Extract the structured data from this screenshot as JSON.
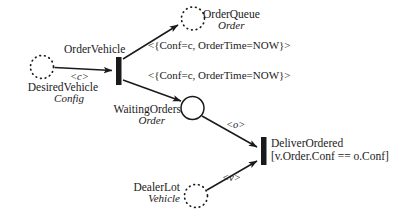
{
  "diagram": {
    "colors": {
      "stroke": "#1a1a1a",
      "text": "#1a1a1a",
      "background": "#ffffff"
    },
    "places": [
      {
        "id": "desired-vehicle",
        "name": "DesiredVehicle",
        "type": "Config",
        "border": "dotted"
      },
      {
        "id": "order-queue",
        "name": "OrderQueue",
        "type": "Order",
        "border": "dotted"
      },
      {
        "id": "waiting-orders",
        "name": "WaitingOrders",
        "type": "Order",
        "border": "solid"
      },
      {
        "id": "dealer-lot",
        "name": "DealerLot",
        "type": "Vehicle",
        "border": "dotted"
      }
    ],
    "transitions": [
      {
        "id": "order-vehicle",
        "name": "OrderVehicle",
        "guard": ""
      },
      {
        "id": "deliver-ordered",
        "name": "DeliverOrdered",
        "guard": "[v.Order.Conf == o.Conf]"
      }
    ],
    "arcs": [
      {
        "id": "arc-desired-to-order",
        "from": "desired-vehicle",
        "to": "order-vehicle",
        "label": "<c>"
      },
      {
        "id": "arc-order-to-queue",
        "from": "order-vehicle",
        "to": "order-queue",
        "label": "<{Conf=c, OrderTime=NOW}>"
      },
      {
        "id": "arc-order-to-waiting",
        "from": "order-vehicle",
        "to": "waiting-orders",
        "label": "<{Conf=c, OrderTime=NOW}>"
      },
      {
        "id": "arc-waiting-to-deliver",
        "from": "waiting-orders",
        "to": "deliver-ordered",
        "label": "<o>"
      },
      {
        "id": "arc-dealer-to-deliver",
        "from": "dealer-lot",
        "to": "deliver-ordered",
        "label": "<v>"
      }
    ]
  }
}
